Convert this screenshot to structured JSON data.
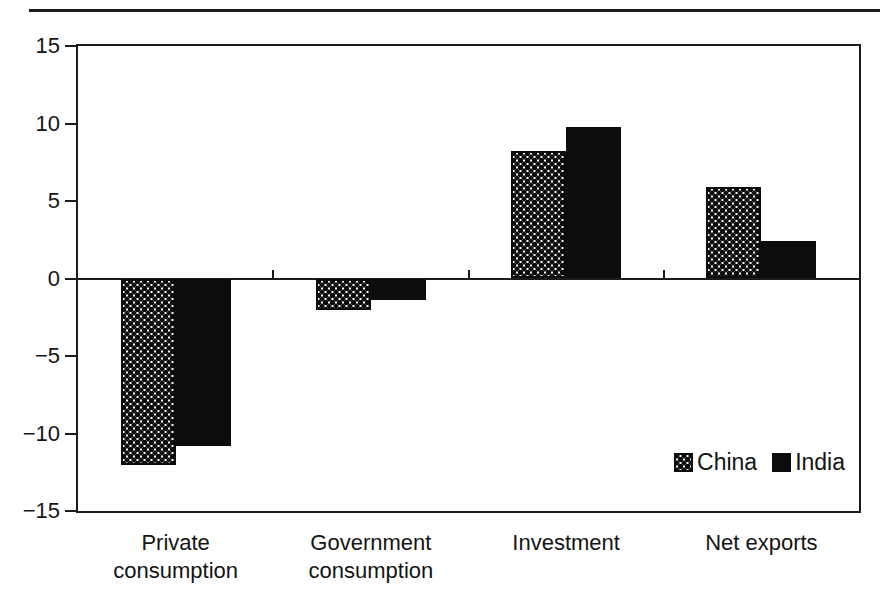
{
  "figure": {
    "top_rule_color": "#1c1c1c",
    "background": "#ffffff",
    "ink_color": "#141414"
  },
  "chart_data": {
    "type": "bar",
    "categories": [
      "Private consumption",
      "Government consumption",
      "Investment",
      "Net exports"
    ],
    "series": [
      {
        "name": "China",
        "style": "dotted-pattern",
        "color": "#0c0c0c",
        "values": [
          -12,
          -2,
          8.2,
          5.9
        ]
      },
      {
        "name": "India",
        "style": "solid",
        "color": "#0c0c0c",
        "values": [
          -10.8,
          -1.4,
          9.8,
          2.4
        ]
      }
    ],
    "ylim": [
      -15,
      15
    ],
    "yticks": [
      15,
      10,
      5,
      0,
      -5,
      -10,
      -15
    ],
    "ytick_labels": [
      "15",
      "10",
      "5",
      "0",
      "−5",
      "−10",
      "−15"
    ],
    "x_boundary_ticks_on_zero_line": true,
    "grid": false,
    "legend": {
      "position": "inside-bottom-right",
      "entries": [
        "China",
        "India"
      ]
    },
    "title": "",
    "xlabel": "",
    "ylabel": ""
  }
}
